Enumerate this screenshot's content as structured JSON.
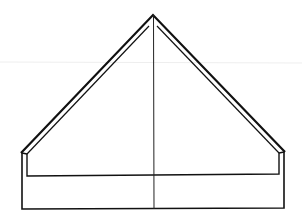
{
  "diagram": {
    "type": "line-drawing",
    "width": 302,
    "height": 219,
    "stroke_color": "#111111",
    "faint_line_color": "#eeeeee",
    "apex": [
      153,
      15
    ],
    "roof_outer": {
      "left_eave": [
        21,
        153
      ],
      "right_eave": [
        285,
        152
      ]
    },
    "roof_inner": {
      "left_eave": [
        27,
        154
      ],
      "right_eave": [
        279,
        153
      ],
      "apex": [
        153,
        20
      ]
    },
    "base_outer": {
      "left_x": 22,
      "right_x": 284,
      "top_y": 153,
      "bottom_y": 209
    },
    "base_inner_ledge": {
      "left_x": 27,
      "right_x": 279,
      "top_y": 154,
      "bottom_y": 176
    },
    "center_axis": {
      "x": 153.5,
      "top_y": 15,
      "bottom_y": 209
    },
    "faint_horizontal_line_y": 62
  }
}
